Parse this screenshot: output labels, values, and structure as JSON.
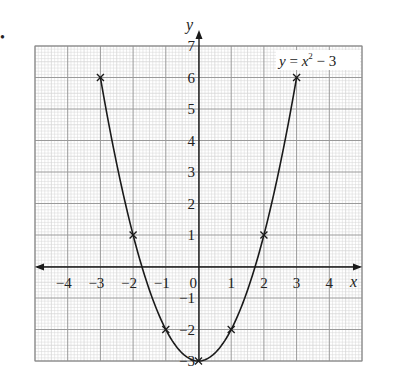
{
  "chart_data": {
    "type": "line",
    "title": "",
    "equation_label": {
      "lhs": "y",
      "eq": " = ",
      "var": "x",
      "exp": "2",
      "rest": " − 3"
    },
    "xlabel": "x",
    "ylabel": "y",
    "xlim": [
      -5,
      5
    ],
    "ylim": [
      -3,
      7
    ],
    "grid": {
      "major": 1,
      "minor": 0.1,
      "on": true
    },
    "x_ticks": [
      "−4",
      "−3",
      "−2",
      "−1",
      "0",
      "1",
      "2",
      "3",
      "4"
    ],
    "y_ticks": [
      "7",
      "6",
      "5",
      "4",
      "3",
      "2",
      "1",
      "−1",
      "−2",
      "−3"
    ],
    "series": [
      {
        "name": "y = x² − 3",
        "x": [
          -3,
          -2,
          -1,
          0,
          1,
          2,
          3
        ],
        "y": [
          6,
          1,
          -2,
          -3,
          -2,
          1,
          6
        ],
        "marker": "x",
        "curve": "smooth"
      }
    ],
    "colors": {
      "grid_minor": "#d6d6d6",
      "grid_major": "#9a9a9a",
      "curve": "#1a1a1a",
      "axis": "#1a1a1a"
    }
  },
  "question_marker": "•"
}
